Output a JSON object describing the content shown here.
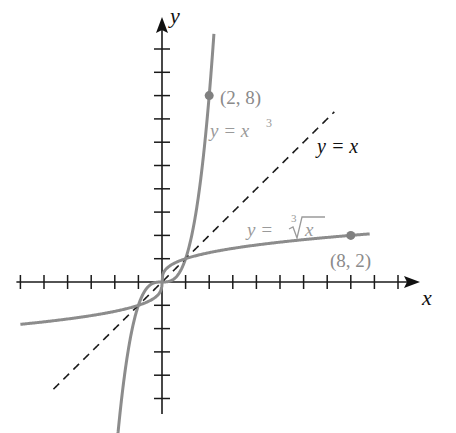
{
  "chart_data": {
    "type": "line",
    "title": "",
    "xlabel": "x",
    "ylabel": "y",
    "xlim": [
      -6,
      10.7
    ],
    "ylim": [
      -5.9,
      11.5
    ],
    "grid": false,
    "x_ticks": [
      -6,
      -5,
      -4,
      -3,
      -2,
      -1,
      1,
      2,
      3,
      4,
      5,
      6,
      7,
      8,
      9,
      10
    ],
    "y_ticks": [
      -5,
      -4,
      -3,
      -2,
      -1,
      1,
      2,
      3,
      4,
      5,
      6,
      7,
      8,
      9,
      10
    ],
    "series": [
      {
        "name": "y = x^3",
        "label": "y = x³",
        "color": "#8c8c8c",
        "style": "solid",
        "domain": [
          -1.9,
          2.2
        ]
      },
      {
        "name": "y = x",
        "label": "y = x",
        "color": "#1a1a1a",
        "style": "dashed",
        "domain": [
          -4.6,
          7.3
        ]
      },
      {
        "name": "y = cbrt(x)",
        "label": "y = ∛x",
        "color": "#8c8c8c",
        "style": "solid",
        "domain": [
          -6,
          8.8
        ]
      }
    ],
    "annotations": [
      {
        "point": [
          2,
          8
        ],
        "text": "(2, 8)"
      },
      {
        "point": [
          8,
          2
        ],
        "text": "(8, 2)"
      }
    ]
  },
  "labels": {
    "x_axis": "x",
    "y_axis": "y",
    "cube_prefix": "y = x",
    "cube_exp": "3",
    "identity": "y = x",
    "root_prefix": "y = ",
    "root_index": "3",
    "root_var": "x",
    "pt1": "(2, 8)",
    "pt2": "(8, 2)"
  }
}
